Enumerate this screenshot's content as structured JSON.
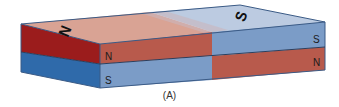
{
  "diagram": {
    "caption": "(A)",
    "top_face": {
      "left_pole": "N",
      "right_pole": "S"
    },
    "front_face": {
      "upper_layer": {
        "left": "N",
        "right": "S"
      },
      "lower_layer": {
        "left": "S",
        "right": "N"
      }
    },
    "colors": {
      "north_dark": "#9b1c1c",
      "north_front": "#b85a4c",
      "north_top": "#d7a090",
      "south_dark": "#2f6aaa",
      "south_front": "#7a9cc6",
      "south_top": "#b9c9e0",
      "edge": "#3b5b86"
    }
  }
}
